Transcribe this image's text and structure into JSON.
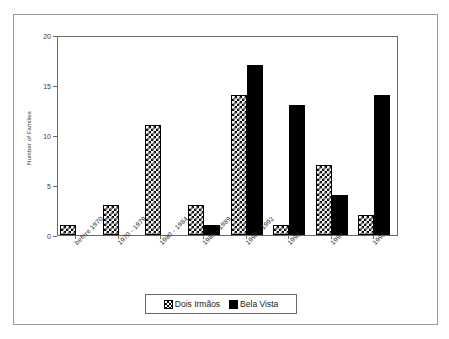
{
  "chart_data": {
    "type": "bar",
    "title": "",
    "xlabel": "",
    "ylabel": "Number of Families",
    "ylim": [
      0,
      20
    ],
    "yticks": [
      0,
      5,
      10,
      15,
      20
    ],
    "grid": false,
    "legend_position": "bottom",
    "categories": [
      "before 1970",
      "1970 - 1979",
      "1980 - 1984",
      "1985 - 1989",
      "1990 - 1992",
      "1993",
      "1994",
      "1995"
    ],
    "series": [
      {
        "name": "Dois Irmãos",
        "pattern": "checker",
        "color": "#000000",
        "values": [
          1,
          3,
          11,
          3,
          14,
          1,
          7,
          2
        ]
      },
      {
        "name": "Bela Vista",
        "pattern": "solid",
        "color": "#000000",
        "values": [
          0,
          0,
          0,
          1,
          17,
          13,
          4,
          14
        ]
      }
    ]
  },
  "legend": {
    "entries": [
      {
        "label": "Dois Irmãos"
      },
      {
        "label": "Bela Vista"
      }
    ]
  }
}
